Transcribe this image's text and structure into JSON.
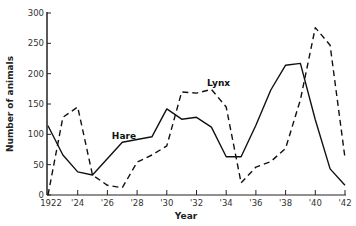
{
  "chart_data": {
    "type": "line",
    "title": "",
    "xlabel": "Year",
    "ylabel": "Number of animals",
    "xlim": [
      1922,
      1942
    ],
    "ylim": [
      0,
      300
    ],
    "grid": false,
    "legend": "inline labels",
    "x_tick_values": [
      1922,
      1924,
      1926,
      1928,
      1930,
      1932,
      1934,
      1936,
      1938,
      1940,
      1942
    ],
    "x_tick_labels": [
      "1922",
      "'24",
      "'26",
      "'28",
      "'30",
      "'32",
      "'34",
      "'36",
      "'38",
      "'40",
      "'42"
    ],
    "y_tick_values": [
      0,
      50,
      100,
      150,
      200,
      250,
      300
    ],
    "y_tick_labels": [
      "0",
      "50",
      "100",
      "150",
      "200",
      "250",
      "300"
    ],
    "series": [
      {
        "name": "Hare",
        "style": "solid",
        "color": "#111111",
        "label_pos": {
          "x": 1926.3,
          "y": 93
        },
        "points": [
          [
            1922,
            114
          ],
          [
            1923,
            66
          ],
          [
            1924,
            38
          ],
          [
            1925,
            33
          ],
          [
            1927,
            87
          ],
          [
            1929,
            96
          ],
          [
            1930,
            142
          ],
          [
            1931,
            125
          ],
          [
            1932,
            128
          ],
          [
            1933,
            112
          ],
          [
            1934,
            63
          ],
          [
            1935,
            63
          ],
          [
            1936,
            115
          ],
          [
            1937,
            173
          ],
          [
            1938,
            214
          ],
          [
            1939,
            217
          ],
          [
            1940,
            124
          ],
          [
            1941,
            43
          ],
          [
            1942,
            16
          ]
        ]
      },
      {
        "name": "Lynx",
        "style": "dashed",
        "color": "#111111",
        "label_pos": {
          "x": 1932.7,
          "y": 180
        },
        "points": [
          [
            1922,
            0
          ],
          [
            1923,
            128
          ],
          [
            1924,
            145
          ],
          [
            1925,
            33
          ],
          [
            1926,
            16
          ],
          [
            1927,
            12
          ],
          [
            1928,
            54
          ],
          [
            1929,
            66
          ],
          [
            1930,
            81
          ],
          [
            1931,
            170
          ],
          [
            1932,
            168
          ],
          [
            1933,
            174
          ],
          [
            1934,
            145
          ],
          [
            1935,
            20
          ],
          [
            1936,
            46
          ],
          [
            1937,
            55
          ],
          [
            1938,
            77
          ],
          [
            1939,
            157
          ],
          [
            1940,
            276
          ],
          [
            1941,
            247
          ],
          [
            1942,
            61
          ]
        ]
      }
    ]
  }
}
